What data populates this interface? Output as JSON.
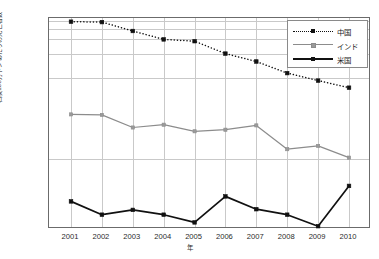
{
  "chart_data": {
    "type": "line",
    "title": "",
    "xlabel": "年",
    "ylabel": "石炭100万トンあたりの死亡者数",
    "x": [
      2001,
      2002,
      2003,
      2004,
      2005,
      2006,
      2007,
      2008,
      2009,
      2010
    ],
    "xtick_labels": [
      "2001",
      "2002",
      "2003",
      "2004",
      "2005",
      "2006",
      "2007",
      "2008",
      "2009",
      "2010"
    ],
    "yscale": "log",
    "ylim": [
      0.012,
      6.6
    ],
    "ytick_values": [
      6.0,
      5.0,
      4.0,
      3.0,
      2.0,
      1.0,
      0.1
    ],
    "ytick_labels": [
      "6.0",
      "5.0",
      "4.0",
      "3.0",
      "2.0",
      "1.0",
      "0.1"
    ],
    "grid": true,
    "legend_position": "upper-right",
    "series": [
      {
        "name": "中国",
        "style": "dotted",
        "color": "#111111",
        "marker": "square",
        "values": [
          4.95,
          4.9,
          3.8,
          3.0,
          2.85,
          2.0,
          1.6,
          1.15,
          0.93,
          0.76
        ]
      },
      {
        "name": "インド",
        "style": "solid",
        "color": "#8c8c8c",
        "marker": "square",
        "values": [
          0.355,
          0.35,
          0.245,
          0.265,
          0.22,
          0.23,
          0.26,
          0.132,
          0.145,
          0.104
        ]
      },
      {
        "name": "米国",
        "style": "solid-bold",
        "color": "#111111",
        "marker": "square",
        "values": [
          0.03,
          0.0205,
          0.0235,
          0.0205,
          0.0165,
          0.0345,
          0.024,
          0.0205,
          0.0148,
          0.0465
        ]
      }
    ]
  },
  "legend": {
    "entries": [
      {
        "label": "中国"
      },
      {
        "label": "インド"
      },
      {
        "label": "米国"
      }
    ]
  }
}
